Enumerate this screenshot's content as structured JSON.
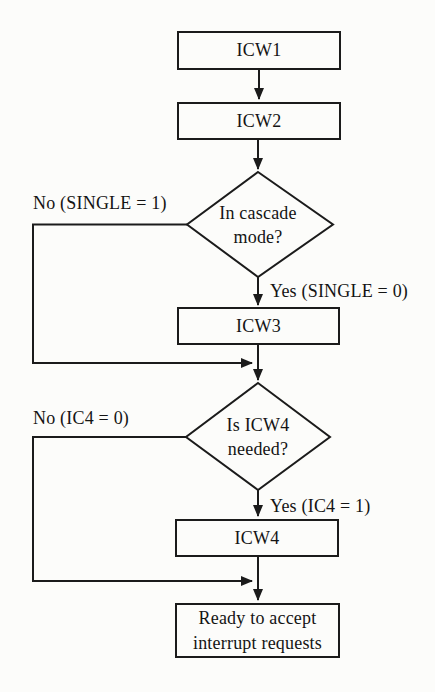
{
  "colors": {
    "background": "#fcfcfa",
    "line": "#1b1b1b",
    "text": "#141414"
  },
  "nodes": {
    "icw1": {
      "label": "ICW1"
    },
    "icw2": {
      "label": "ICW2"
    },
    "cascade_decision": {
      "line1": "In cascade",
      "line2": "mode?"
    },
    "icw3": {
      "label": "ICW3"
    },
    "icw4_decision": {
      "line1": "Is ICW4",
      "line2": "needed?"
    },
    "icw4": {
      "label": "ICW4"
    },
    "ready": {
      "line1": "Ready to accept",
      "line2": "interrupt requests"
    }
  },
  "edge_labels": {
    "cascade_no": "No (SINGLE = 1)",
    "cascade_yes": "Yes (SINGLE = 0)",
    "icw4_no": "No (IC4 = 0)",
    "icw4_yes": "Yes (IC4 = 1)"
  }
}
